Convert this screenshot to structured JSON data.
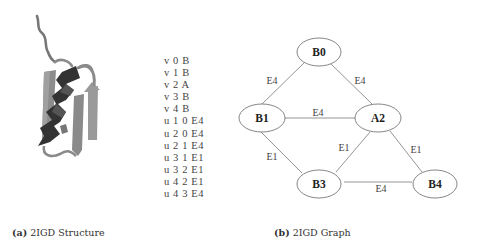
{
  "figure": {
    "panel_a": {
      "label": "(a)",
      "caption": "2IGD Structure"
    },
    "panel_b": {
      "label": "(b)",
      "caption": "2IGD Graph"
    },
    "graph_listing": [
      "v 0 B",
      "v 1 B",
      "v 2 A",
      "v 3 B",
      "v 4 B",
      "u 1 0 E4",
      "u 2 0 E4",
      "u 2 1 E4",
      "u 3 1 E1",
      "u 3 2 E1",
      "u 4 2 E1",
      "u 4 3 E4"
    ],
    "graph": {
      "nodes": [
        {
          "id": "B0",
          "label": "B0"
        },
        {
          "id": "B1",
          "label": "B1"
        },
        {
          "id": "A2",
          "label": "A2"
        },
        {
          "id": "B3",
          "label": "B3"
        },
        {
          "id": "B4",
          "label": "B4"
        }
      ],
      "edges": [
        {
          "from": "B1",
          "to": "B0",
          "label": "E4"
        },
        {
          "from": "A2",
          "to": "B0",
          "label": "E4"
        },
        {
          "from": "A2",
          "to": "B1",
          "label": "E4"
        },
        {
          "from": "B3",
          "to": "B1",
          "label": "E1"
        },
        {
          "from": "B3",
          "to": "A2",
          "label": "E1"
        },
        {
          "from": "B4",
          "to": "A2",
          "label": "E1"
        },
        {
          "from": "B4",
          "to": "B3",
          "label": "E4"
        }
      ]
    }
  }
}
